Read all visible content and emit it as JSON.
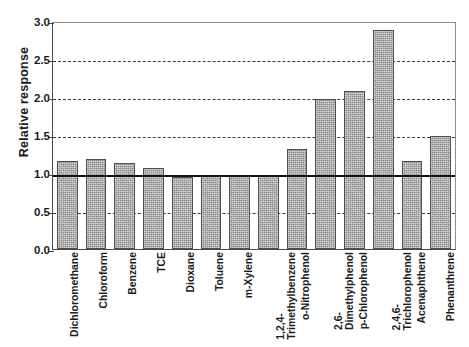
{
  "chart_data": {
    "type": "bar",
    "title": "",
    "xlabel": "",
    "ylabel": "Relative response",
    "ylim": [
      0.0,
      3.0
    ],
    "ytick_labels": [
      "0.0",
      "0.5",
      "1.0",
      "1.5",
      "2.0",
      "2.5",
      "3.0"
    ],
    "ytick_values": [
      0.0,
      0.5,
      1.0,
      1.5,
      2.0,
      2.5,
      3.0
    ],
    "grid": "horizontal dashed gridlines at 0.5, 1.5, 2.0, 2.5",
    "gridlines": [
      0.5,
      1.5,
      2.0,
      2.5
    ],
    "reference_line": 1.0,
    "legend": "none",
    "legend_position": "none",
    "categories": [
      "Dichloromethane",
      "Chloroform",
      "Benzene",
      "TCE",
      "Dioxane",
      "Toluene",
      "m-Xylene",
      "1,2,4-Trimethylbenzene",
      "o-Nitrophenol",
      "2,6-Dimethylphenol",
      "p-Chlorophenol",
      "2,4,6-Trichlorophenol",
      "Acenaphthene",
      "Phenanthrene"
    ],
    "category_label_lines": [
      [
        "Dichloromethane"
      ],
      [
        "Chloroform"
      ],
      [
        "Benzene"
      ],
      [
        "TCE"
      ],
      [
        "Dioxane"
      ],
      [
        "Toluene"
      ],
      [
        "m-Xylene"
      ],
      [
        "1,2,4-",
        "Trimethylbenzene"
      ],
      [
        "o-Nitrophenol"
      ],
      [
        "2,6-",
        "Dimethylphenol"
      ],
      [
        "p-Chlorophenol"
      ],
      [
        "2,4,6-",
        "Trichlorophenol"
      ],
      [
        "Acenaphthene"
      ],
      [
        "Phenanthrene"
      ]
    ],
    "values": [
      1.16,
      1.18,
      1.13,
      1.07,
      0.95,
      0.98,
      0.96,
      0.98,
      1.32,
      1.98,
      2.08,
      2.88,
      1.16,
      1.49
    ],
    "bar_color": "#a9a9a9",
    "bar_edge_color": "#4f4f4f",
    "reference_line_color": "#111111",
    "grid_color": "#3b3b3b",
    "axis_color": "#4a4a4a"
  }
}
